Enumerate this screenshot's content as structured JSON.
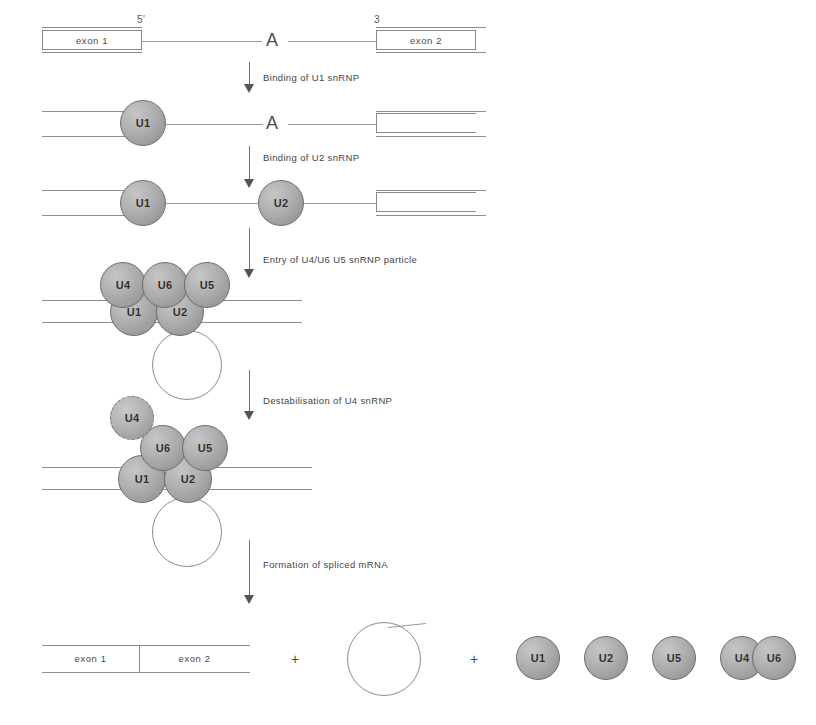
{
  "figure": {
    "branch_point_label": "A",
    "five_prime_label": "5'",
    "three_prime_label": "3",
    "plus_sign": "+"
  },
  "exons": {
    "exon1": "exon 1",
    "exon2": "exon 2"
  },
  "steps": [
    {
      "id": "step1",
      "label": "Binding of U1 snRNP"
    },
    {
      "id": "step2",
      "label": "Binding of U2 snRNP"
    },
    {
      "id": "step3",
      "label": "Entry of U4/U6 U5 snRNP particle"
    },
    {
      "id": "step4",
      "label": "Destabilisation of U4 snRNP"
    },
    {
      "id": "step5",
      "label": "Formation of spliced mRNA"
    }
  ],
  "snrnps": {
    "u1": "U1",
    "u2": "U2",
    "u4": "U4",
    "u5": "U5",
    "u6": "U6"
  },
  "stages": [
    {
      "name": "pre-mRNA",
      "particles": []
    },
    {
      "name": "U1 bound complex",
      "particles": [
        "U1"
      ]
    },
    {
      "name": "U1 and U2 bound complex",
      "particles": [
        "U1",
        "U2"
      ]
    },
    {
      "name": "Complete spliceosome",
      "particles": [
        "U4",
        "U6",
        "U5",
        "U1",
        "U2"
      ]
    },
    {
      "name": "Activated spliceosome with U4 released",
      "particles": [
        "U4",
        "U6",
        "U5",
        "U1",
        "U2"
      ]
    },
    {
      "name": "Products",
      "particles": [
        "U1",
        "U2",
        "U5",
        "U4",
        "U6"
      ]
    }
  ],
  "products": {
    "spliced_mrna_exon1": "exon 1",
    "spliced_mrna_exon2": "exon 2",
    "released_snrnps": [
      "U1",
      "U2",
      "U5",
      "U4",
      "U6"
    ]
  },
  "colors": {
    "snrnp_fill": "#b0b0b0",
    "snrnp_border": "#6d6d6d",
    "strand_line": "#8d8d8d",
    "arrow": "#545454",
    "text": "#454545"
  }
}
